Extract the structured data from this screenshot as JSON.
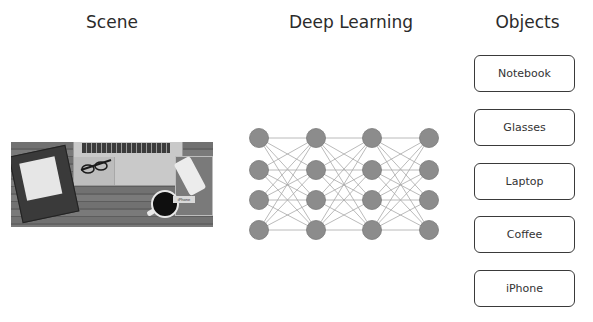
{
  "headings": {
    "scene": "Scene",
    "deep_learning": "Deep Learning",
    "objects": "Objects"
  },
  "scene_image": {
    "description": "Top-down photo of a wooden desk with a notebook, glasses, laptop, phone and coffee cup",
    "tag_label": "iPhone"
  },
  "network": {
    "layers": 4,
    "nodes_per_layer": 4,
    "node_color": "#8c8c8c",
    "edge_color": "#a8a8a8",
    "column_x": [
      19,
      76,
      132,
      189
    ],
    "row_y": [
      18,
      50,
      80,
      110
    ]
  },
  "objects": [
    {
      "label": "Notebook"
    },
    {
      "label": "Glasses"
    },
    {
      "label": "Laptop"
    },
    {
      "label": "Coffee"
    },
    {
      "label": "iPhone"
    }
  ]
}
